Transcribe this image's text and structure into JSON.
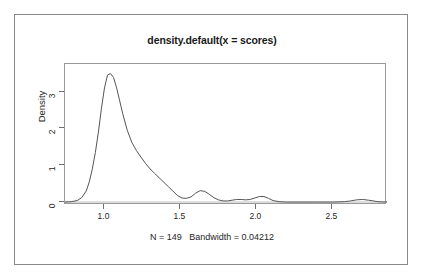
{
  "figure": {
    "title": "density.default(x = scores)",
    "subtitle": "N = 149   Bandwidth = 0.04212",
    "ylabel": "Density",
    "xlabel": ""
  },
  "chart_data": {
    "type": "line",
    "title": "density.default(x = scores)",
    "subtitle": "N = 149   Bandwidth = 0.04212",
    "xlabel": "",
    "ylabel": "Density",
    "n": 149,
    "bandwidth": 0.04212,
    "grid": false,
    "legend": null,
    "line_color": "#555555",
    "xlim": [
      0.74,
      2.86
    ],
    "ylim": [
      -0.08,
      3.75
    ],
    "xticks": [
      1.0,
      1.5,
      2.0,
      2.5
    ],
    "xtick_labels": [
      "1.0",
      "1.5",
      "2.0",
      "2.5"
    ],
    "yticks": [
      0,
      1,
      2,
      3
    ],
    "ytick_labels": [
      "0",
      "1",
      "2",
      "3"
    ],
    "series": [
      {
        "name": "density",
        "x": [
          0.74,
          0.78,
          0.82,
          0.85,
          0.88,
          0.9,
          0.92,
          0.94,
          0.96,
          0.98,
          1.0,
          1.02,
          1.04,
          1.06,
          1.08,
          1.1,
          1.12,
          1.15,
          1.18,
          1.21,
          1.24,
          1.27,
          1.3,
          1.33,
          1.36,
          1.39,
          1.42,
          1.45,
          1.48,
          1.51,
          1.54,
          1.57,
          1.6,
          1.63,
          1.66,
          1.69,
          1.72,
          1.75,
          1.78,
          1.81,
          1.84,
          1.87,
          1.9,
          1.93,
          1.96,
          1.99,
          2.02,
          2.05,
          2.08,
          2.11,
          2.15,
          2.2,
          2.3,
          2.4,
          2.5,
          2.58,
          2.62,
          2.66,
          2.7,
          2.74,
          2.8,
          2.86
        ],
        "y": [
          0.0,
          0.01,
          0.04,
          0.12,
          0.3,
          0.55,
          0.9,
          1.35,
          1.9,
          2.55,
          3.1,
          3.45,
          3.49,
          3.38,
          3.1,
          2.75,
          2.4,
          1.95,
          1.62,
          1.4,
          1.22,
          1.05,
          0.9,
          0.78,
          0.66,
          0.54,
          0.42,
          0.3,
          0.18,
          0.11,
          0.1,
          0.14,
          0.24,
          0.31,
          0.29,
          0.21,
          0.12,
          0.06,
          0.03,
          0.03,
          0.05,
          0.07,
          0.07,
          0.06,
          0.07,
          0.11,
          0.15,
          0.15,
          0.1,
          0.04,
          0.01,
          0.0,
          0.0,
          0.0,
          0.0,
          0.01,
          0.03,
          0.06,
          0.07,
          0.05,
          0.01,
          0.0
        ]
      }
    ],
    "annotations": [
      {
        "text": "primary mode",
        "x": 1.04,
        "y": 3.49
      },
      {
        "text": "secondary mode",
        "x": 1.63,
        "y": 0.31
      },
      {
        "text": "minor mode",
        "x": 2.04,
        "y": 0.15
      },
      {
        "text": "far-right mode",
        "x": 2.7,
        "y": 0.07
      }
    ]
  }
}
